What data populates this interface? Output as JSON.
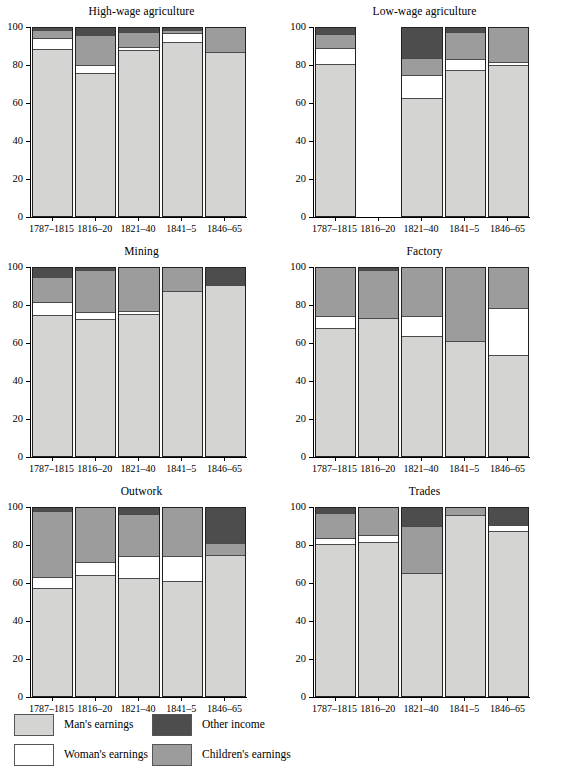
{
  "legend": {
    "items": [
      {
        "label": "Man's earnings",
        "key": "man",
        "color": "#d4d4d2"
      },
      {
        "label": "Woman's earnings",
        "key": "woman",
        "color": "#ffffff"
      },
      {
        "label": "Other income",
        "key": "other",
        "color": "#4d4d4d"
      },
      {
        "label": "Children's earnings",
        "key": "children",
        "color": "#9c9c9c"
      }
    ]
  },
  "axis": {
    "yticks": [
      0,
      20,
      40,
      60,
      80,
      100
    ],
    "ylim": [
      0,
      100
    ]
  },
  "chart_data": [
    {
      "type": "bar",
      "title": "High-wage agriculture",
      "xlabel": "",
      "ylabel": "",
      "ylim": [
        0,
        100
      ],
      "grid": false,
      "legend_position": "bottom",
      "stacked": true,
      "categories": [
        "1787–1815",
        "1816–20",
        "1821–40",
        "1841–5",
        "1846–65"
      ],
      "series": [
        {
          "name": "Man's earnings",
          "values": [
            88.5,
            76.0,
            88.0,
            92.0,
            87.0
          ]
        },
        {
          "name": "Woman's earnings",
          "values": [
            5.5,
            4.0,
            1.5,
            5.0,
            0.0
          ]
        },
        {
          "name": "Children's earnings",
          "values": [
            4.5,
            16.0,
            8.0,
            1.5,
            13.0
          ]
        },
        {
          "name": "Other income",
          "values": [
            1.5,
            4.0,
            2.5,
            1.5,
            0.0
          ]
        }
      ]
    },
    {
      "type": "bar",
      "title": "Low-wage agriculture",
      "xlabel": "",
      "ylabel": "",
      "ylim": [
        0,
        100
      ],
      "grid": false,
      "legend_position": "bottom",
      "stacked": true,
      "categories": [
        "1787–1815",
        "1816–20",
        "1821–40",
        "1841–5",
        "1846–65"
      ],
      "series": [
        {
          "name": "Man's earnings",
          "values": [
            80.5,
            null,
            62.5,
            77.5,
            80.0
          ]
        },
        {
          "name": "Woman's earnings",
          "values": [
            8.5,
            null,
            12.0,
            5.5,
            1.5
          ]
        },
        {
          "name": "Children's earnings",
          "values": [
            7.5,
            null,
            9.0,
            14.5,
            18.5
          ]
        },
        {
          "name": "Other income",
          "values": [
            3.5,
            null,
            16.5,
            2.5,
            0.0
          ]
        }
      ],
      "notes": "No data for 1816–20"
    },
    {
      "type": "bar",
      "title": "Mining",
      "xlabel": "",
      "ylabel": "",
      "ylim": [
        0,
        100
      ],
      "grid": false,
      "legend_position": "bottom",
      "stacked": true,
      "categories": [
        "1787–1815",
        "1816–20",
        "1821–40",
        "1841–5",
        "1846–65"
      ],
      "series": [
        {
          "name": "Man's earnings",
          "values": [
            75.0,
            72.5,
            75.5,
            87.5,
            90.5
          ]
        },
        {
          "name": "Woman's earnings",
          "values": [
            6.5,
            4.0,
            1.5,
            0.0,
            0.0
          ]
        },
        {
          "name": "Children's earnings",
          "values": [
            13.5,
            22.0,
            23.0,
            12.5,
            0.0
          ]
        },
        {
          "name": "Other income",
          "values": [
            5.0,
            1.5,
            0.0,
            0.0,
            9.5
          ]
        }
      ]
    },
    {
      "type": "bar",
      "title": "Factory",
      "xlabel": "",
      "ylabel": "",
      "ylim": [
        0,
        100
      ],
      "grid": false,
      "legend_position": "bottom",
      "stacked": true,
      "categories": [
        "1787–1815",
        "1816–20",
        "1821–40",
        "1841–5",
        "1846–65"
      ],
      "series": [
        {
          "name": "Man's earnings",
          "values": [
            68.0,
            73.0,
            63.5,
            61.0,
            53.5
          ]
        },
        {
          "name": "Woman's earnings",
          "values": [
            6.0,
            0.0,
            10.5,
            0.0,
            25.0
          ]
        },
        {
          "name": "Children's earnings",
          "values": [
            26.0,
            25.5,
            26.0,
            39.0,
            21.5
          ]
        },
        {
          "name": "Other income",
          "values": [
            0.0,
            1.5,
            0.0,
            0.0,
            0.0
          ]
        }
      ]
    },
    {
      "type": "bar",
      "title": "Outwork",
      "xlabel": "",
      "ylabel": "",
      "ylim": [
        0,
        100
      ],
      "grid": false,
      "legend_position": "bottom",
      "stacked": true,
      "categories": [
        "1787–1815",
        "1816–20",
        "1821–40",
        "1841–5",
        "1846–65"
      ],
      "series": [
        {
          "name": "Man's earnings",
          "values": [
            57.5,
            64.0,
            62.5,
            61.0,
            74.5
          ]
        },
        {
          "name": "Woman's earnings",
          "values": [
            5.5,
            7.0,
            11.5,
            13.0,
            0.0
          ]
        },
        {
          "name": "Children's earnings",
          "values": [
            35.0,
            29.0,
            22.5,
            26.0,
            6.5
          ]
        },
        {
          "name": "Other income",
          "values": [
            2.0,
            0.0,
            3.5,
            0.0,
            19.0
          ]
        }
      ]
    },
    {
      "type": "bar",
      "title": "Trades",
      "xlabel": "",
      "ylabel": "",
      "ylim": [
        0,
        100
      ],
      "grid": false,
      "legend_position": "bottom",
      "stacked": true,
      "categories": [
        "1787–1815",
        "1816–20",
        "1821–40",
        "1841–5",
        "1846–65"
      ],
      "series": [
        {
          "name": "Man's earnings",
          "values": [
            80.5,
            81.5,
            65.5,
            96.0,
            87.5
          ]
        },
        {
          "name": "Woman's earnings",
          "values": [
            3.0,
            4.0,
            0.0,
            0.0,
            3.0
          ]
        },
        {
          "name": "Children's earnings",
          "values": [
            13.5,
            14.5,
            24.5,
            4.0,
            0.0
          ]
        },
        {
          "name": "Other income",
          "values": [
            3.0,
            0.0,
            10.0,
            0.0,
            9.5
          ]
        }
      ]
    }
  ]
}
